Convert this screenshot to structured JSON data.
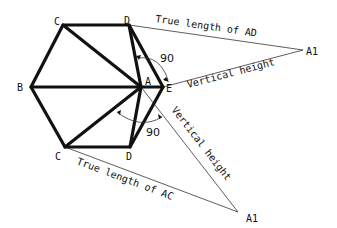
{
  "diagram": {
    "vertex_labels": {
      "C_top": "C",
      "D_top": "D",
      "B": "B",
      "A": "A",
      "E": "E",
      "C_bottom": "C",
      "D_bottom": "D",
      "A1_top": "A1",
      "A1_bottom": "A1"
    },
    "annotations": {
      "true_length_ad": "True length of AD",
      "vertical_height_top": "Vertical height",
      "vertical_height_bottom": "Vertical height",
      "true_length_ac": "True length of AC"
    },
    "angles": {
      "top": "90",
      "bottom": "90"
    },
    "colors": {
      "line": "#111111",
      "background": "#ffffff"
    }
  }
}
